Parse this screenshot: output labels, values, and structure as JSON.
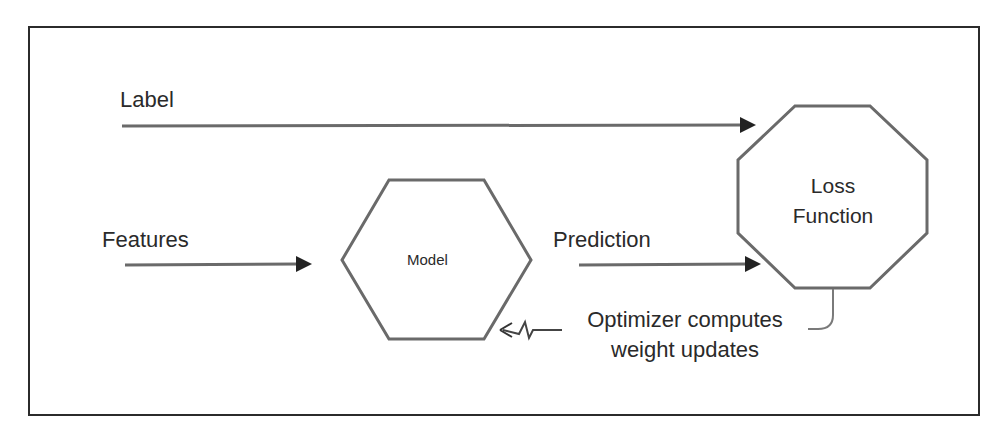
{
  "diagram": {
    "type": "ml-training-loop",
    "colors": {
      "frame": "#2b2b2b",
      "shape_stroke": "#666666",
      "arrow": "#666666",
      "arrowhead": "#222222",
      "text": "#2a2a2a",
      "background": "#ffffff"
    },
    "inputs": {
      "label": "Label",
      "features": "Features"
    },
    "nodes": {
      "model": {
        "shape": "hexagon",
        "label": "Model"
      },
      "loss": {
        "shape": "octagon",
        "line1": "Loss",
        "line2": "Function"
      }
    },
    "edges": {
      "prediction": "Prediction",
      "optimizer_line1": "Optimizer computes",
      "optimizer_line2": "weight updates"
    }
  }
}
